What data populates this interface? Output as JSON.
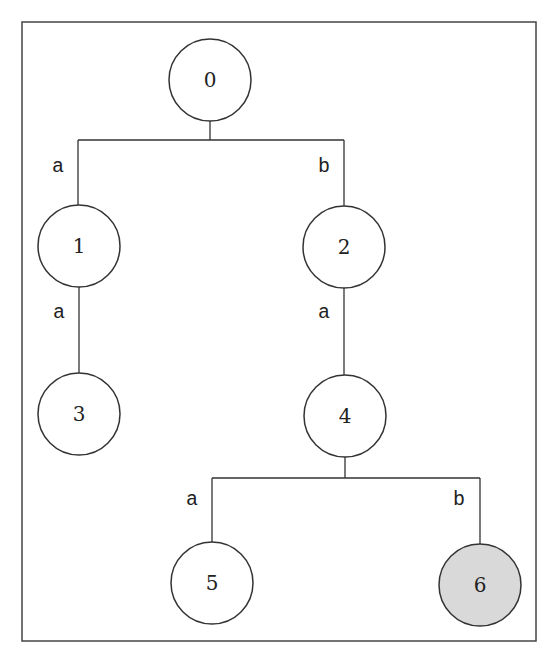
{
  "diagram": {
    "type": "trie",
    "frame": {
      "x": 22,
      "y": 22,
      "w": 514,
      "h": 619
    },
    "nodes": [
      {
        "id": "0",
        "label": "0",
        "cx": 210,
        "cy": 80,
        "highlighted": false
      },
      {
        "id": "1",
        "label": "1",
        "cx": 79,
        "cy": 246,
        "highlighted": false
      },
      {
        "id": "2",
        "label": "2",
        "cx": 344,
        "cy": 247,
        "highlighted": false
      },
      {
        "id": "3",
        "label": "3",
        "cx": 79,
        "cy": 414,
        "highlighted": false
      },
      {
        "id": "4",
        "label": "4",
        "cx": 345,
        "cy": 416,
        "highlighted": false
      },
      {
        "id": "5",
        "label": "5",
        "cx": 212,
        "cy": 583,
        "highlighted": false
      },
      {
        "id": "6",
        "label": "6",
        "cx": 480,
        "cy": 585,
        "highlighted": true
      }
    ],
    "edges": [
      {
        "from": "0",
        "to": "1",
        "label": "a"
      },
      {
        "from": "0",
        "to": "2",
        "label": "b"
      },
      {
        "from": "1",
        "to": "3",
        "label": "a"
      },
      {
        "from": "2",
        "to": "4",
        "label": "a"
      },
      {
        "from": "4",
        "to": "5",
        "label": "a"
      },
      {
        "from": "4",
        "to": "6",
        "label": "b"
      }
    ],
    "colors": {
      "stroke": "#333333",
      "node_fill": "#ffffff",
      "highlight_fill": "#d9d9d9"
    }
  }
}
